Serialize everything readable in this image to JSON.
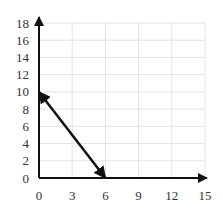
{
  "chart_data": {
    "type": "line",
    "title": "",
    "xlabel": "",
    "ylabel": "",
    "xlim": [
      0,
      15
    ],
    "ylim": [
      0,
      18
    ],
    "grid": true,
    "x_ticks": [
      0,
      3,
      6,
      9,
      12,
      15
    ],
    "y_ticks": [
      0,
      2,
      4,
      6,
      8,
      10,
      12,
      14,
      16,
      18
    ],
    "x_tick_labels": [
      "0",
      "3",
      "6",
      "9",
      "12",
      "15"
    ],
    "y_tick_labels": [
      "0",
      "2",
      "4",
      "6",
      "8",
      "10",
      "12",
      "14",
      "16",
      "18"
    ],
    "series": [
      {
        "name": "segment",
        "x": [
          0,
          6
        ],
        "y": [
          10,
          0
        ],
        "arrowheads": "both"
      }
    ],
    "colors": {
      "axis": "#111111",
      "grid": "#e3e3e3",
      "line": "#111111",
      "text": "#333333"
    }
  }
}
